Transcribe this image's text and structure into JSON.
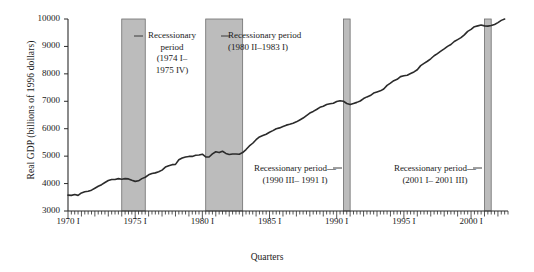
{
  "chart_data": {
    "type": "line",
    "title": "",
    "xlabel": "Quarters",
    "ylabel": "Real GDP (billions of 1996 dollars)",
    "ylim": [
      3000,
      10000
    ],
    "xlim": [
      1970.0,
      2002.75
    ],
    "yticks": [
      "3000",
      "4000",
      "5000",
      "6000",
      "7000",
      "8000",
      "9000",
      "10000"
    ],
    "ytick_values": [
      3000,
      4000,
      5000,
      6000,
      7000,
      8000,
      9000,
      10000
    ],
    "xticks": [
      "1970 I",
      "1975 I",
      "1980 I",
      "1985 I",
      "1990 I",
      "1995 I",
      "2000 I"
    ],
    "xtick_values": [
      1970,
      1975,
      1980,
      1985,
      1990,
      1995,
      2000
    ],
    "grid": false,
    "legend": "none",
    "minor_tick_interval_quarters": 1,
    "series": [
      {
        "name": "Real GDP",
        "x": [
          1970.0,
          1970.25,
          1970.5,
          1970.75,
          1971.0,
          1971.25,
          1971.5,
          1971.75,
          1972.0,
          1972.25,
          1972.5,
          1972.75,
          1973.0,
          1973.25,
          1973.5,
          1973.75,
          1974.0,
          1974.25,
          1974.5,
          1974.75,
          1975.0,
          1975.25,
          1975.5,
          1975.75,
          1976.0,
          1976.25,
          1976.5,
          1976.75,
          1977.0,
          1977.25,
          1977.5,
          1977.75,
          1978.0,
          1978.25,
          1978.5,
          1978.75,
          1979.0,
          1979.25,
          1979.5,
          1979.75,
          1980.0,
          1980.25,
          1980.5,
          1980.75,
          1981.0,
          1981.25,
          1981.5,
          1981.75,
          1982.0,
          1982.25,
          1982.5,
          1982.75,
          1983.0,
          1983.25,
          1983.5,
          1983.75,
          1984.0,
          1984.25,
          1984.5,
          1984.75,
          1985.0,
          1985.25,
          1985.5,
          1985.75,
          1986.0,
          1986.25,
          1986.5,
          1986.75,
          1987.0,
          1987.25,
          1987.5,
          1987.75,
          1988.0,
          1988.25,
          1988.5,
          1988.75,
          1989.0,
          1989.25,
          1989.5,
          1989.75,
          1990.0,
          1990.25,
          1990.5,
          1990.75,
          1991.0,
          1991.25,
          1991.5,
          1991.75,
          1992.0,
          1992.25,
          1992.5,
          1992.75,
          1993.0,
          1993.25,
          1993.5,
          1993.75,
          1994.0,
          1994.25,
          1994.5,
          1994.75,
          1995.0,
          1995.25,
          1995.5,
          1995.75,
          1996.0,
          1996.25,
          1996.5,
          1996.75,
          1997.0,
          1997.25,
          1997.5,
          1997.75,
          1998.0,
          1998.25,
          1998.5,
          1998.75,
          1999.0,
          1999.25,
          1999.5,
          1999.75,
          2000.0,
          2000.25,
          2000.5,
          2000.75,
          2001.0,
          2001.25,
          2001.5,
          2001.75,
          2002.0,
          2002.25,
          2002.5
        ],
        "values": [
          3580,
          3570,
          3600,
          3570,
          3660,
          3700,
          3720,
          3760,
          3830,
          3900,
          3960,
          4040,
          4110,
          4150,
          4150,
          4180,
          4160,
          4180,
          4170,
          4120,
          4080,
          4100,
          4180,
          4230,
          4320,
          4370,
          4390,
          4430,
          4490,
          4600,
          4650,
          4690,
          4700,
          4870,
          4930,
          4970,
          4990,
          4990,
          5030,
          5040,
          5070,
          4970,
          4970,
          5080,
          5160,
          5130,
          5180,
          5100,
          5060,
          5080,
          5080,
          5070,
          5130,
          5240,
          5370,
          5470,
          5600,
          5700,
          5750,
          5800,
          5870,
          5930,
          6000,
          6030,
          6080,
          6130,
          6160,
          6200,
          6250,
          6320,
          6390,
          6480,
          6570,
          6630,
          6700,
          6780,
          6820,
          6880,
          6910,
          6930,
          6990,
          7020,
          7000,
          6920,
          6880,
          6920,
          6960,
          7010,
          7100,
          7160,
          7210,
          7300,
          7340,
          7380,
          7450,
          7580,
          7660,
          7750,
          7800,
          7900,
          7930,
          7950,
          8010,
          8070,
          8150,
          8300,
          8380,
          8460,
          8550,
          8660,
          8740,
          8830,
          8910,
          9000,
          9070,
          9180,
          9250,
          9320,
          9420,
          9550,
          9620,
          9720,
          9750,
          9780,
          9750,
          9740,
          9760,
          9800,
          9870,
          9950,
          10000
        ]
      }
    ],
    "recession_bands": [
      {
        "id": "recession-1974",
        "start": 1974.0,
        "end": 1975.75,
        "label_lines": [
          "Recessionary",
          "period",
          "(1974 I–",
          "1975 IV)"
        ],
        "label_align": "center",
        "leader_side": "right"
      },
      {
        "id": "recession-1980",
        "start": 1980.25,
        "end": 1983.0,
        "label_lines": [
          "Recessionary period",
          "(1980 II–1983 I)"
        ],
        "label_align": "left",
        "leader_side": "right"
      },
      {
        "id": "recession-1990",
        "start": 1990.5,
        "end": 1991.0,
        "label_lines": [
          "Recessionary period—",
          "(1990 III– 1991 I)"
        ],
        "label_align": "center",
        "leader_side": "left"
      },
      {
        "id": "recession-2001",
        "start": 2001.0,
        "end": 2001.5,
        "label_lines": [
          "Recessionary period—",
          "(2001 I– 2001 III)"
        ],
        "label_align": "center",
        "leader_side": "left"
      }
    ],
    "colors": {
      "band_fill": "#bcbcbc",
      "band_stroke": "#6e6e6e",
      "line": "#2b2b2b",
      "axis": "#2b2b2b",
      "text": "#1a1a1a",
      "background": "#ffffff"
    }
  }
}
